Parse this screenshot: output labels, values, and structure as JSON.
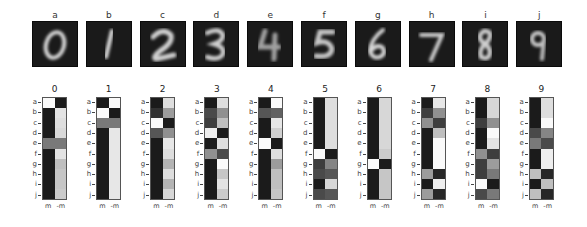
{
  "chart_data": [
    {
      "type": "image_grid",
      "title": "",
      "panels": [
        {
          "label": "a",
          "digit": "0"
        },
        {
          "label": "b",
          "digit": "1"
        },
        {
          "label": "c",
          "digit": "2"
        },
        {
          "label": "d",
          "digit": "3"
        },
        {
          "label": "e",
          "digit": "4"
        },
        {
          "label": "f",
          "digit": "5"
        },
        {
          "label": "g",
          "digit": "6"
        },
        {
          "label": "h",
          "digit": "7"
        },
        {
          "label": "i",
          "digit": "8"
        },
        {
          "label": "j",
          "digit": "9"
        }
      ],
      "description": "Mean grayscale images of handwritten digits 0-9 on black background"
    },
    {
      "type": "heatmap",
      "colormap": "gray (0=black, 1=white)",
      "row_labels": [
        "a",
        "b",
        "c",
        "d",
        "e",
        "f",
        "g",
        "h",
        "i",
        "j"
      ],
      "col_labels": [
        "m",
        "-m"
      ],
      "matrices": [
        {
          "title": "0",
          "values": [
            [
              1.0,
              0.05
            ],
            [
              0.05,
              0.9
            ],
            [
              0.05,
              0.88
            ],
            [
              0.05,
              0.86
            ],
            [
              0.45,
              0.45
            ],
            [
              0.05,
              0.9
            ],
            [
              0.05,
              0.75
            ],
            [
              0.05,
              0.78
            ],
            [
              0.05,
              0.78
            ],
            [
              0.05,
              0.8
            ]
          ]
        },
        {
          "title": "1",
          "values": [
            [
              0.05,
              1.0
            ],
            [
              1.0,
              0.05
            ],
            [
              0.45,
              0.45
            ],
            [
              0.05,
              0.92
            ],
            [
              0.05,
              0.92
            ],
            [
              0.05,
              0.92
            ],
            [
              0.05,
              0.92
            ],
            [
              0.05,
              0.92
            ],
            [
              0.05,
              0.92
            ],
            [
              0.05,
              0.92
            ]
          ]
        },
        {
          "title": "2",
          "values": [
            [
              0.05,
              0.88
            ],
            [
              0.15,
              0.6
            ],
            [
              1.0,
              0.05
            ],
            [
              0.3,
              0.55
            ],
            [
              0.05,
              0.92
            ],
            [
              0.05,
              0.88
            ],
            [
              0.05,
              0.7
            ],
            [
              0.05,
              0.88
            ],
            [
              0.05,
              0.7
            ],
            [
              0.05,
              0.85
            ]
          ]
        },
        {
          "title": "3",
          "values": [
            [
              0.05,
              0.88
            ],
            [
              0.25,
              0.55
            ],
            [
              0.2,
              0.75
            ],
            [
              0.95,
              0.05
            ],
            [
              0.05,
              0.88
            ],
            [
              0.55,
              0.25
            ],
            [
              0.05,
              1.0
            ],
            [
              0.05,
              0.78
            ],
            [
              0.05,
              0.9
            ],
            [
              0.05,
              0.8
            ]
          ]
        },
        {
          "title": "4",
          "values": [
            [
              0.05,
              1.0
            ],
            [
              0.3,
              0.35
            ],
            [
              0.05,
              0.92
            ],
            [
              0.05,
              0.82
            ],
            [
              1.0,
              0.05
            ],
            [
              0.05,
              0.88
            ],
            [
              0.05,
              0.6
            ],
            [
              0.05,
              0.75
            ],
            [
              0.05,
              0.75
            ],
            [
              0.05,
              0.78
            ]
          ]
        },
        {
          "title": "5",
          "values": [
            [
              0.05,
              0.88
            ],
            [
              0.05,
              0.88
            ],
            [
              0.05,
              0.88
            ],
            [
              0.05,
              0.88
            ],
            [
              0.05,
              0.88
            ],
            [
              1.0,
              0.05
            ],
            [
              0.2,
              0.5
            ],
            [
              0.25,
              0.3
            ],
            [
              0.05,
              0.85
            ],
            [
              0.25,
              0.3
            ]
          ]
        },
        {
          "title": "6",
          "values": [
            [
              0.05,
              0.85
            ],
            [
              0.05,
              0.85
            ],
            [
              0.05,
              0.85
            ],
            [
              0.05,
              0.85
            ],
            [
              0.05,
              0.85
            ],
            [
              0.05,
              0.8
            ],
            [
              1.0,
              0.05
            ],
            [
              0.05,
              0.78
            ],
            [
              0.05,
              0.78
            ],
            [
              0.05,
              0.78
            ]
          ]
        },
        {
          "title": "7",
          "values": [
            [
              0.05,
              0.92
            ],
            [
              0.2,
              0.55
            ],
            [
              0.55,
              0.2
            ],
            [
              0.05,
              0.75
            ],
            [
              0.05,
              1.0
            ],
            [
              0.05,
              1.0
            ],
            [
              0.05,
              1.0
            ],
            [
              0.6,
              0.1
            ],
            [
              0.05,
              0.95
            ],
            [
              0.6,
              0.1
            ]
          ]
        },
        {
          "title": "8",
          "values": [
            [
              0.05,
              0.85
            ],
            [
              0.05,
              0.85
            ],
            [
              0.2,
              0.55
            ],
            [
              0.05,
              1.0
            ],
            [
              0.05,
              0.9
            ],
            [
              0.55,
              0.2
            ],
            [
              0.2,
              0.6
            ],
            [
              0.2,
              0.45
            ],
            [
              1.0,
              0.05
            ],
            [
              0.25,
              0.45
            ]
          ]
        },
        {
          "title": "9",
          "values": [
            [
              0.05,
              0.88
            ],
            [
              0.05,
              0.88
            ],
            [
              0.05,
              1.0
            ],
            [
              0.25,
              0.5
            ],
            [
              0.45,
              0.25
            ],
            [
              0.05,
              0.95
            ],
            [
              0.05,
              0.95
            ],
            [
              0.75,
              0.1
            ],
            [
              0.05,
              0.75
            ],
            [
              0.75,
              0.1
            ]
          ]
        }
      ]
    }
  ]
}
